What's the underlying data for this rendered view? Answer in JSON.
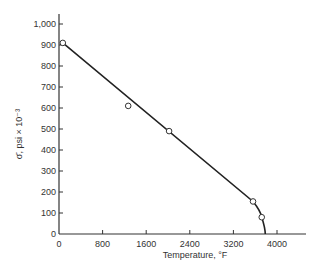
{
  "chart_data": {
    "type": "line",
    "title": "",
    "xlabel": "Temperature, °F",
    "ylabel": "σ̄, psi × 10⁻³",
    "xlim": [
      0,
      4500
    ],
    "ylim": [
      0,
      1050
    ],
    "x_ticks": [
      0,
      800,
      1600,
      2400,
      3200,
      4000
    ],
    "x_tick_labels": [
      "0",
      "800",
      "1600",
      "2400",
      "3200",
      "4000"
    ],
    "y_ticks": [
      0,
      100,
      200,
      300,
      400,
      500,
      600,
      700,
      800,
      900,
      1000
    ],
    "y_tick_labels": [
      "0",
      "100",
      "200",
      "300",
      "400",
      "500",
      "600",
      "700",
      "800",
      "900",
      "1,000"
    ],
    "grid": false,
    "legend": null,
    "series": [
      {
        "name": "data points",
        "style": "open-circle",
        "x": [
          70,
          1270,
          2020,
          3560,
          3720
        ],
        "y": [
          910,
          610,
          490,
          155,
          80
        ]
      },
      {
        "name": "fitted curve",
        "style": "line",
        "x": [
          70,
          3560,
          3720,
          3780,
          3790
        ],
        "y": [
          910,
          155,
          80,
          20,
          0
        ]
      }
    ]
  }
}
